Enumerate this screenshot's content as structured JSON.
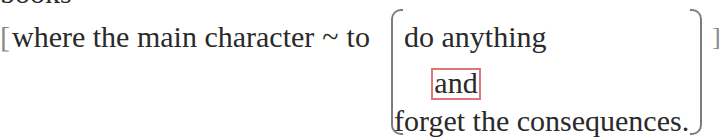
{
  "document": {
    "top_line_partial": "books",
    "main_line": {
      "open_bracket": "[",
      "prefix": "where the main character",
      "tilde": "~",
      "to": "to",
      "close_bracket": "]"
    },
    "options": {
      "line1": "do anything",
      "connector": "and",
      "line3": "forget the consequences."
    },
    "colors": {
      "text": "#2a2a2a",
      "bracket": "#7c7c7c",
      "highlight_box": "#e0747a"
    }
  }
}
